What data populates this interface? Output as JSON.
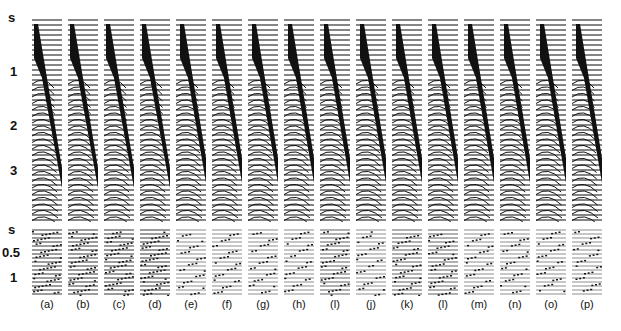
{
  "figure": {
    "top_axis": {
      "labels": [
        "s",
        "1",
        "2",
        "3"
      ]
    },
    "bottom_axis": {
      "labels": [
        "s",
        "0.5",
        "1"
      ]
    },
    "panels": [
      {
        "label": "(a)"
      },
      {
        "label": "(b)"
      },
      {
        "label": "(c)"
      },
      {
        "label": "(d)"
      },
      {
        "label": "(e)"
      },
      {
        "label": "(f)"
      },
      {
        "label": "(g)"
      },
      {
        "label": "(h)"
      },
      {
        "label": "(l)"
      },
      {
        "label": "(j)"
      },
      {
        "label": "(k)"
      },
      {
        "label": "(l)"
      },
      {
        "label": "(m)"
      },
      {
        "label": "(n)"
      },
      {
        "label": "(o)"
      },
      {
        "label": "(p)"
      }
    ]
  }
}
